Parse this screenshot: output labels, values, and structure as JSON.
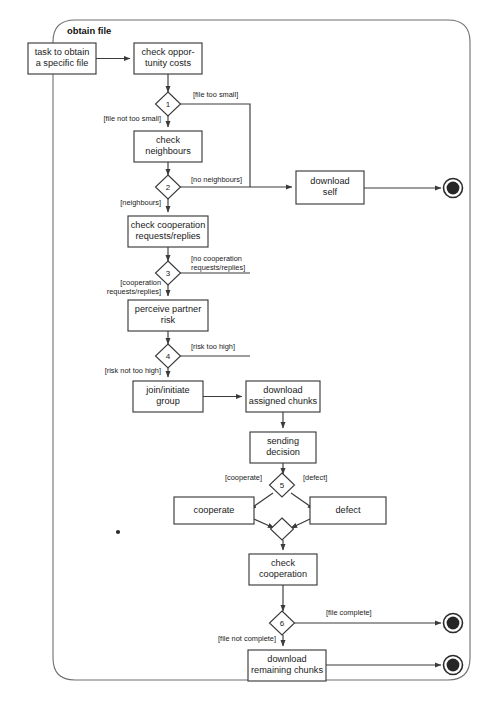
{
  "frame": {
    "title": "obtain file",
    "x": 53,
    "y": 20,
    "width": 417,
    "height": 660,
    "corner_radius": 22
  },
  "colors": {
    "node_stroke": "#3b3b3b",
    "frame_stroke": "#6e6e6e",
    "text": "#1a1a1a",
    "end_fill": "#262626",
    "background": "#ffffff"
  },
  "activities": [
    {
      "id": "task-to-obtain",
      "lines": [
        "task to obtain",
        "a specific file"
      ],
      "x": 28,
      "y": 43,
      "w": 68,
      "h": 31
    },
    {
      "id": "check-opportunity",
      "lines": [
        "check oppor-",
        "tunity costs"
      ],
      "x": 134,
      "y": 43,
      "w": 68,
      "h": 31
    },
    {
      "id": "check-neighbours",
      "lines": [
        "check",
        "neighbours"
      ],
      "x": 134,
      "y": 131,
      "w": 68,
      "h": 31
    },
    {
      "id": "check-cooperation-req",
      "lines": [
        "check cooperation",
        "requests/replies"
      ],
      "x": 128,
      "y": 216,
      "w": 80,
      "h": 31
    },
    {
      "id": "perceive-partner-risk",
      "lines": [
        "perceive partner",
        "risk"
      ],
      "x": 128,
      "y": 300,
      "w": 80,
      "h": 31
    },
    {
      "id": "join-initiate-group",
      "lines": [
        "join/initiate",
        "group"
      ],
      "x": 133,
      "y": 381,
      "w": 70,
      "h": 31
    },
    {
      "id": "download-assigned",
      "lines": [
        "download",
        "assigned chunks"
      ],
      "x": 246,
      "y": 381,
      "w": 74,
      "h": 31
    },
    {
      "id": "sending-decision",
      "lines": [
        "sending",
        "decision"
      ],
      "x": 250,
      "y": 432,
      "w": 66,
      "h": 31
    },
    {
      "id": "cooperate",
      "lines": [
        "cooperate"
      ],
      "x": 174,
      "y": 497,
      "w": 80,
      "h": 27
    },
    {
      "id": "defect",
      "lines": [
        "defect"
      ],
      "x": 310,
      "y": 497,
      "w": 76,
      "h": 27
    },
    {
      "id": "check-cooperation",
      "lines": [
        "check",
        "cooperation"
      ],
      "x": 249,
      "y": 554,
      "w": 68,
      "h": 31
    },
    {
      "id": "download-self",
      "lines": [
        "download",
        "self"
      ],
      "x": 296,
      "y": 171,
      "w": 68,
      "h": 33
    },
    {
      "id": "download-remaining",
      "lines": [
        "download",
        "remaining chunks"
      ],
      "x": 248,
      "y": 650,
      "w": 78,
      "h": 31
    }
  ],
  "decisions": [
    {
      "id": "decision-1",
      "label": "1",
      "cx": 168,
      "cy": 104
    },
    {
      "id": "decision-2",
      "label": "2",
      "cx": 168,
      "cy": 187
    },
    {
      "id": "decision-3",
      "label": "3",
      "cx": 168,
      "cy": 273
    },
    {
      "id": "decision-4",
      "label": "4",
      "cx": 168,
      "cy": 356
    },
    {
      "id": "decision-5",
      "label": "5",
      "cx": 282,
      "cy": 485
    },
    {
      "id": "decision-6",
      "label": "6",
      "cx": 282,
      "cy": 623
    }
  ],
  "merge_node": {
    "id": "merge-cooperate-defect",
    "cx": 282,
    "cy": 529
  },
  "end_nodes": [
    {
      "id": "end-download-self",
      "cx": 453,
      "cy": 188
    },
    {
      "id": "end-file-complete",
      "cx": 453,
      "cy": 623
    },
    {
      "id": "end-remaining-complete",
      "cx": 453,
      "cy": 665
    }
  ],
  "guards": [
    {
      "id": "guard-file-too-small",
      "text": "[file too small]",
      "x": 193,
      "y": 95,
      "anchor": "start"
    },
    {
      "id": "guard-file-not-too-small",
      "text": "[file not too small]",
      "x": 161,
      "y": 119,
      "anchor": "end"
    },
    {
      "id": "guard-no-neighbours",
      "text": "[no neighbours]",
      "x": 191,
      "y": 180,
      "anchor": "start"
    },
    {
      "id": "guard-neighbours",
      "text": "[neighbours]",
      "x": 161,
      "y": 203,
      "anchor": "end"
    },
    {
      "id": "guard-no-coop-line1",
      "text": "[no cooperation",
      "x": 191,
      "y": 259,
      "anchor": "start"
    },
    {
      "id": "guard-no-coop-line2",
      "text": "requests/replies]",
      "x": 191,
      "y": 268,
      "anchor": "start"
    },
    {
      "id": "guard-coop-line1",
      "text": "[cooperation",
      "x": 161,
      "y": 283,
      "anchor": "end"
    },
    {
      "id": "guard-coop-line2",
      "text": "requests/replies]",
      "x": 161,
      "y": 292,
      "anchor": "end"
    },
    {
      "id": "guard-risk-too-high",
      "text": "[risk too high]",
      "x": 191,
      "y": 347,
      "anchor": "start"
    },
    {
      "id": "guard-risk-not-too-high",
      "text": "[risk not too high]",
      "x": 161,
      "y": 371,
      "anchor": "end"
    },
    {
      "id": "guard-cooperate",
      "text": "[cooperate]",
      "x": 262,
      "y": 478,
      "anchor": "end"
    },
    {
      "id": "guard-defect",
      "text": "[defect]",
      "x": 303,
      "y": 478,
      "anchor": "start"
    },
    {
      "id": "guard-file-complete",
      "text": "[file complete]",
      "x": 326,
      "y": 613,
      "anchor": "start"
    },
    {
      "id": "guard-file-not-complete",
      "text": "[file not complete]",
      "x": 276,
      "y": 639,
      "anchor": "end"
    }
  ],
  "edges": [
    {
      "id": "edge-task-to-check-opportunity",
      "d": "M 96 58.5 L 130 58.5",
      "arrow": true
    },
    {
      "id": "edge-check-opportunity-to-d1",
      "d": "M 168 74 L 168 92",
      "arrow": true
    },
    {
      "id": "edge-d1-file-too-small",
      "d": "M 180 104 L 250 104 L 250 187",
      "arrow": false
    },
    {
      "id": "edge-d1-to-check-neighbours",
      "d": "M 168 116 L 168 127",
      "arrow": true
    },
    {
      "id": "edge-check-neighbours-to-d2",
      "d": "M 168 162 L 168 175",
      "arrow": true
    },
    {
      "id": "edge-d2-no-neighbours-to-download-self",
      "d": "M 180 187 L 292 187",
      "arrow": true
    },
    {
      "id": "edge-d2-to-check-coop",
      "d": "M 168 199 L 168 212",
      "arrow": true
    },
    {
      "id": "edge-check-coop-to-d3",
      "d": "M 168 247 L 168 261",
      "arrow": true
    },
    {
      "id": "edge-d3-no-coop",
      "d": "M 180 273 L 250 273",
      "arrow": false
    },
    {
      "id": "edge-d3-to-perceive",
      "d": "M 168 285 L 168 296",
      "arrow": true
    },
    {
      "id": "edge-perceive-to-d4",
      "d": "M 168 331 L 168 344",
      "arrow": true
    },
    {
      "id": "edge-d4-risk-too-high",
      "d": "M 180 356 L 250 356",
      "arrow": false
    },
    {
      "id": "edge-d4-to-join",
      "d": "M 168 368 L 168 377",
      "arrow": true
    },
    {
      "id": "edge-join-to-download-assigned",
      "d": "M 203 396.5 L 242 396.5",
      "arrow": true
    },
    {
      "id": "edge-download-assigned-to-sending",
      "d": "M 283 412 L 283 428",
      "arrow": true
    },
    {
      "id": "edge-sending-to-d5",
      "d": "M 283 463 L 283 474",
      "arrow": true
    },
    {
      "id": "edge-d5-cooperate",
      "d": "M 273 493 L 250 509",
      "arrow": true
    },
    {
      "id": "edge-d5-defect",
      "d": "M 291 493 L 314 509",
      "arrow": true
    },
    {
      "id": "edge-cooperate-to-merge",
      "d": "M 254 519 L 274 528",
      "arrow": true
    },
    {
      "id": "edge-defect-to-merge",
      "d": "M 310 519 L 291 528",
      "arrow": true
    },
    {
      "id": "edge-merge-to-check-cooperation",
      "d": "M 283 540 L 283 550",
      "arrow": true
    },
    {
      "id": "edge-check-cooperation-to-d6",
      "d": "M 283 585 L 283 611",
      "arrow": true
    },
    {
      "id": "edge-d6-file-complete-to-end",
      "d": "M 294 623 L 441 623",
      "arrow": true
    },
    {
      "id": "edge-d6-to-download-remaining",
      "d": "M 283 635 L 283 646",
      "arrow": true
    },
    {
      "id": "edge-download-remaining-to-end",
      "d": "M 326 665 L 441 665",
      "arrow": true
    },
    {
      "id": "edge-download-self-to-end",
      "d": "M 364 188 L 441 188",
      "arrow": true
    }
  ],
  "speck": {
    "id": "page-speck",
    "cx": 118,
    "cy": 532,
    "r": 2.1
  }
}
